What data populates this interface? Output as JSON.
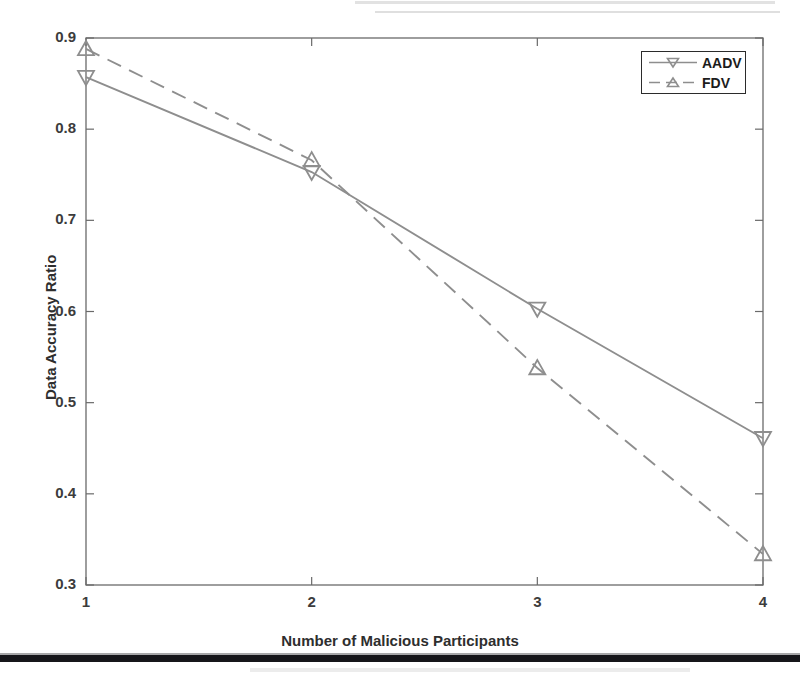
{
  "figure": {
    "background_color": "#ffffff",
    "line_color": "#8e8e8e",
    "frame_color": "#6a6a6a",
    "text_color": "#2e2e2e"
  },
  "chart_data": {
    "type": "line",
    "title": "",
    "xlabel": "Number of Malicious Participants",
    "ylabel": "Data Accuracy Ratio",
    "x": [
      1,
      2,
      3,
      4
    ],
    "xticklabels": [
      "1",
      "2",
      "3",
      "4"
    ],
    "yticks": [
      0.3,
      0.4,
      0.5,
      0.6,
      0.7,
      0.8,
      0.9
    ],
    "yticklabels": [
      "0.3",
      "0.4",
      "0.5",
      "0.6",
      "0.7",
      "0.8",
      "0.9"
    ],
    "xlim": [
      1,
      4
    ],
    "ylim": [
      0.3,
      0.9
    ],
    "grid": false,
    "legend_position": "top-right",
    "series": [
      {
        "name": "AADV",
        "values": [
          0.857,
          0.753,
          0.603,
          0.461
        ],
        "linestyle": "solid",
        "marker": "triangle-down",
        "color": "#8e8e8e"
      },
      {
        "name": "FDV",
        "values": [
          0.888,
          0.766,
          0.538,
          0.334
        ],
        "linestyle": "dashed",
        "marker": "triangle-up",
        "color": "#8e8e8e"
      }
    ]
  },
  "legend": {
    "items": [
      {
        "label": "AADV",
        "marker": "triangle-down-icon",
        "linestyle": "solid"
      },
      {
        "label": "FDV",
        "marker": "triangle-up-icon",
        "linestyle": "dashed"
      }
    ]
  },
  "artifacts": {
    "bottom_bar": "scan-bar",
    "top_streak": "scan-streak"
  }
}
